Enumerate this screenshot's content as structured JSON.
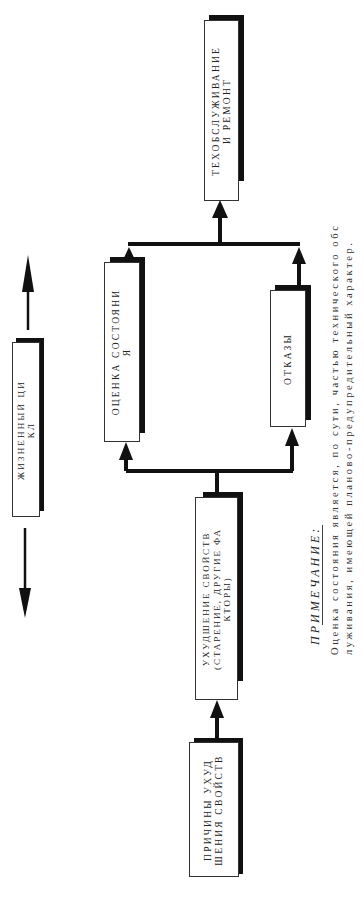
{
  "diagram": {
    "orientation": "rotated-90-ccw",
    "boxes": {
      "maintenance": {
        "lines": [
          "ТЕХОБСЛУЖИВАНИЕ",
          "И РЕМОНТ"
        ]
      },
      "condition_assessment": {
        "lines": [
          "ОЦЕНКА СОСТОЯНИ",
          "Я"
        ]
      },
      "failures": {
        "lines": [
          "ОТКАЗЫ"
        ]
      },
      "degradation": {
        "lines": [
          "УХУДШЕНИЕ СВОЙСТВ",
          "(СТАРЕНИЕ, ДРУГИЕ ФА",
          "КТОРЫ)"
        ]
      },
      "causes": {
        "lines": [
          "ПРИЧИНЫ УХУД",
          "ШЕНИЯ СВОЙСТВ"
        ]
      },
      "life_cycle": {
        "lines": [
          "ЖИЗНЕННЫЙ ЦИ",
          "КЛ"
        ]
      }
    },
    "connections": [
      {
        "from": "causes",
        "to": "degradation"
      },
      {
        "from": "degradation",
        "to": "condition_assessment"
      },
      {
        "from": "degradation",
        "to": "failures"
      },
      {
        "from": "condition_assessment",
        "to": "maintenance"
      },
      {
        "from": "failures",
        "to": "maintenance"
      }
    ],
    "life_cycle_arrows": [
      "toward-maintenance",
      "toward-causes"
    ]
  },
  "note": {
    "title": "ПРИМЕЧАНИЕ:",
    "lines": [
      "Оценка состояния является, по сути, частью технического обс",
      "луживания, имеющей планово-предупредительный характер."
    ]
  },
  "colors": {
    "line": "#111111",
    "box_border": "#333333",
    "shadow": "#111111",
    "text": "#222222"
  }
}
